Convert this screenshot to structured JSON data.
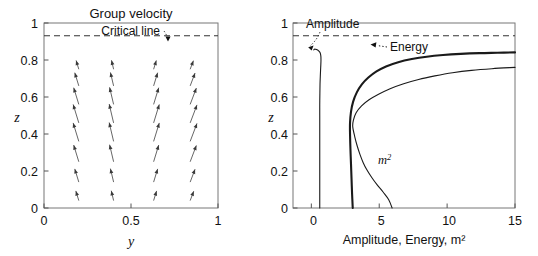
{
  "figure": {
    "width": 538,
    "height": 256,
    "background": "#ffffff",
    "line_color": "#1a1a1a",
    "axis_color": "#555555"
  },
  "chart_data": [
    {
      "id": "left-panel",
      "type": "quiver",
      "title": "Group velocity",
      "xlabel": "y",
      "ylabel": "z",
      "xlim": [
        0,
        1
      ],
      "ylim": [
        0,
        1
      ],
      "xticks": [
        0,
        0.5,
        1
      ],
      "xtick_labels": [
        "0",
        "0.5",
        "1"
      ],
      "yticks": [
        0,
        0.2,
        0.4,
        0.6,
        0.8,
        1
      ],
      "ytick_labels": [
        "0",
        "0.2",
        "0.4",
        "0.6",
        "0.8",
        "1"
      ],
      "grid": false,
      "annotations": [
        {
          "text": "Critical line",
          "x": 0.64,
          "y": 0.945,
          "arrow_to_x": 0.755,
          "arrow_to_y": 0.852,
          "style": "dotted-leader"
        }
      ],
      "reference_lines": [
        {
          "name": "critical-line",
          "orientation": "horizontal",
          "y": 0.85,
          "style": "dashed"
        }
      ],
      "vector_field": {
        "description": "Arrows tilt away from the vertical mid-plane: left columns point up-left, right columns point up-right; magnitude grows toward mid-height and shrinks near z=0 and the critical line.",
        "columns_y": [
          0.2,
          0.4,
          0.63,
          0.84
        ],
        "rows_z": [
          0.04,
          0.14,
          0.25,
          0.36,
          0.46,
          0.56,
          0.66,
          0.75
        ],
        "angles_deg_by_column": [
          108,
          104,
          72,
          68
        ],
        "lengths_by_row": [
          0.055,
          0.075,
          0.095,
          0.105,
          0.105,
          0.095,
          0.075,
          0.05
        ]
      }
    },
    {
      "id": "right-panel",
      "type": "line",
      "title": "",
      "xlabel": "Amplitude, Energy, m²",
      "ylabel": "z",
      "xlim": [
        -1.35,
        15
      ],
      "ylim": [
        0,
        1
      ],
      "xticks": [
        0,
        5,
        10,
        15
      ],
      "xtick_labels": [
        "0",
        "5",
        "10",
        "15"
      ],
      "yticks": [
        0,
        0.2,
        0.4,
        0.6,
        0.8,
        1
      ],
      "ytick_labels": [
        "0",
        "0.2",
        "0.4",
        "0.6",
        "0.8",
        "1"
      ],
      "grid": false,
      "reference_lines": [
        {
          "name": "critical-line",
          "orientation": "horizontal",
          "y": 0.85,
          "style": "dashed"
        }
      ],
      "annotations": [
        {
          "text": "Amplitude",
          "x": 1.05,
          "y": 0.955,
          "arrow_to_x": 0.62,
          "arrow_to_y": 0.795,
          "style": "dotted-leader"
        },
        {
          "text": "Energy",
          "x": 6.55,
          "y": 0.8,
          "arrow_to_x": 4.35,
          "arrow_to_y": 0.822,
          "style": "dotted-leader"
        },
        {
          "text": "m²",
          "x": 6.2,
          "y": 0.235,
          "style": "plain"
        }
      ],
      "series": [
        {
          "name": "Amplitude",
          "stroke_width": 1.1,
          "points": [
            [
              0.62,
              0.0
            ],
            [
              0.62,
              0.1
            ],
            [
              0.62,
              0.2
            ],
            [
              0.62,
              0.3
            ],
            [
              0.62,
              0.4
            ],
            [
              0.62,
              0.5
            ],
            [
              0.62,
              0.56
            ],
            [
              0.63,
              0.62
            ],
            [
              0.64,
              0.67
            ],
            [
              0.66,
              0.71
            ],
            [
              0.68,
              0.745
            ],
            [
              0.7,
              0.775
            ],
            [
              0.71,
              0.8
            ],
            [
              0.7,
              0.822
            ],
            [
              0.64,
              0.84
            ],
            [
              0.52,
              0.851
            ],
            [
              0.38,
              0.857
            ],
            [
              0.28,
              0.859
            ],
            [
              0.22,
              0.858
            ],
            [
              0.18,
              0.855
            ]
          ]
        },
        {
          "name": "Energy",
          "stroke_width": 2.1,
          "points": [
            [
              3.05,
              0.0
            ],
            [
              3.0,
              0.08
            ],
            [
              2.96,
              0.16
            ],
            [
              2.92,
              0.24
            ],
            [
              2.88,
              0.32
            ],
            [
              2.85,
              0.4
            ],
            [
              2.85,
              0.46
            ],
            [
              2.92,
              0.52
            ],
            [
              3.08,
              0.575
            ],
            [
              3.35,
              0.625
            ],
            [
              3.72,
              0.668
            ],
            [
              4.2,
              0.705
            ],
            [
              4.8,
              0.738
            ],
            [
              5.5,
              0.765
            ],
            [
              6.4,
              0.788
            ],
            [
              7.4,
              0.805
            ],
            [
              8.5,
              0.818
            ],
            [
              9.7,
              0.827
            ],
            [
              11.0,
              0.833
            ],
            [
              12.4,
              0.837
            ],
            [
              13.7,
              0.839
            ],
            [
              15.0,
              0.841
            ]
          ]
        },
        {
          "name": "m²",
          "stroke_width": 1.1,
          "points": [
            [
              5.95,
              0.0
            ],
            [
              5.7,
              0.045
            ],
            [
              5.3,
              0.085
            ],
            [
              4.85,
              0.125
            ],
            [
              4.45,
              0.165
            ],
            [
              4.1,
              0.205
            ],
            [
              3.82,
              0.245
            ],
            [
              3.58,
              0.29
            ],
            [
              3.38,
              0.335
            ],
            [
              3.2,
              0.385
            ],
            [
              3.05,
              0.44
            ],
            [
              3.1,
              0.475
            ],
            [
              3.3,
              0.515
            ],
            [
              3.7,
              0.552
            ],
            [
              4.25,
              0.585
            ],
            [
              4.95,
              0.615
            ],
            [
              5.8,
              0.645
            ],
            [
              6.8,
              0.672
            ],
            [
              7.9,
              0.695
            ],
            [
              9.1,
              0.714
            ],
            [
              10.4,
              0.731
            ],
            [
              11.8,
              0.744
            ],
            [
              13.3,
              0.753
            ],
            [
              15.0,
              0.76
            ]
          ]
        }
      ]
    }
  ]
}
